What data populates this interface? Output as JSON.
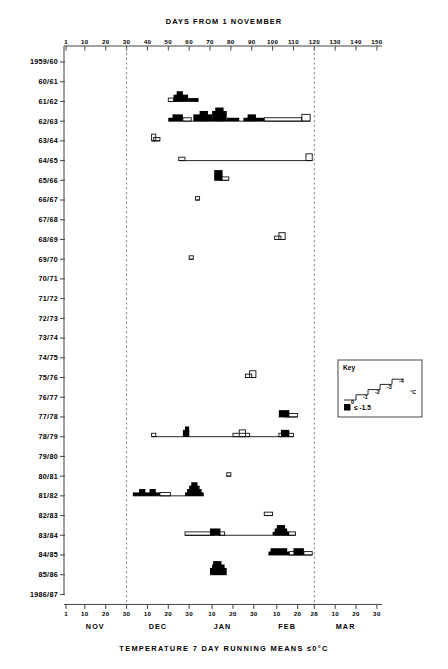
{
  "chart_data": {
    "type": "line",
    "title": "DAYS FROM 1 NOVEMBER",
    "caption": "TEMPERATURE  7 DAY RUNNING MEANS   ≤0°C",
    "xlabel": "DAYS FROM 1 NOVEMBER",
    "ylabel": "",
    "xlim": [
      0,
      155
    ],
    "x_ticks": [
      1,
      10,
      20,
      30,
      40,
      50,
      60,
      70,
      80,
      90,
      100,
      110,
      120,
      130,
      140,
      150
    ],
    "x_tick_labels": [
      "1",
      "10",
      "20",
      "30",
      "40",
      "50",
      "60",
      "70",
      "80",
      "90",
      "100",
      "110",
      "120",
      "130",
      "140",
      "150"
    ],
    "grid": false,
    "legend_position": "right-middle",
    "vertical_dashed_lines": [
      30,
      120
    ],
    "bottom_axis": {
      "label": "calendar days by month",
      "months": [
        {
          "name": "NOV",
          "ticks": [
            {
              "label": "1",
              "day": 1
            },
            {
              "label": "10",
              "day": 10
            },
            {
              "label": "20",
              "day": 20
            },
            {
              "label": "30",
              "day": 30
            }
          ],
          "center_day": 15
        },
        {
          "name": "DEC",
          "ticks": [
            {
              "label": "10",
              "day": 40
            },
            {
              "label": "20",
              "day": 50
            },
            {
              "label": "30",
              "day": 60
            }
          ],
          "center_day": 45
        },
        {
          "name": "JAN",
          "ticks": [
            {
              "label": "10",
              "day": 71
            },
            {
              "label": "20",
              "day": 81
            },
            {
              "label": "30",
              "day": 91
            }
          ],
          "center_day": 76
        },
        {
          "name": "FEB",
          "ticks": [
            {
              "label": "10",
              "day": 102
            },
            {
              "label": "20",
              "day": 112
            },
            {
              "label": "28",
              "day": 120
            }
          ],
          "center_day": 107
        },
        {
          "name": "MAR",
          "ticks": [
            {
              "label": "10",
              "day": 130
            },
            {
              "label": "20",
              "day": 140
            },
            {
              "label": "30",
              "day": 150
            }
          ],
          "center_day": 135
        }
      ]
    },
    "key": {
      "title": "Key",
      "unit": "°C",
      "step_labels": [
        "0",
        "-1",
        "-2",
        "-3",
        "-4"
      ],
      "filled_label": "≤ -1.5",
      "filled_color": "#000000"
    },
    "categories": [
      "1959/60",
      "60/61",
      "61/62",
      "62/63",
      "63/64",
      "64/65",
      "65/66",
      "66/67",
      "67/68",
      "68/69",
      "69/70",
      "70/71",
      "71/72",
      "72/73",
      "73/74",
      "74/75",
      "75/76",
      "76/77",
      "77/78",
      "78/79",
      "79/80",
      "80/81",
      "81/82",
      "82/83",
      "83/84",
      "84/85",
      "85/86",
      "1986/87"
    ],
    "series": [
      {
        "name": "1959/60",
        "segments": []
      },
      {
        "name": "60/61",
        "segments": []
      },
      {
        "name": "61/62",
        "segments": [
          {
            "day": 50,
            "width": 2.5,
            "level": 1,
            "filled": false
          },
          {
            "day": 52.5,
            "width": 7,
            "level": 2,
            "filled": true
          },
          {
            "day": 54,
            "width": 3,
            "level": 3,
            "filled": true
          },
          {
            "day": 59.5,
            "width": 5,
            "level": 1,
            "filled": true
          }
        ]
      },
      {
        "name": "62/63",
        "segments": [
          {
            "day": 50,
            "width": 3,
            "level": 1,
            "filled": true
          },
          {
            "day": 52,
            "width": 5,
            "level": 2,
            "filled": true
          },
          {
            "day": 57,
            "width": 4,
            "level": 1,
            "filled": false
          },
          {
            "day": 62,
            "width": 9,
            "level": 2,
            "filled": true
          },
          {
            "day": 65,
            "width": 4,
            "level": 3,
            "filled": true
          },
          {
            "day": 71,
            "width": 7,
            "level": 3,
            "filled": true
          },
          {
            "day": 72.5,
            "width": 4,
            "level": 4,
            "filled": true
          },
          {
            "day": 78,
            "width": 6,
            "level": 1,
            "filled": true
          },
          {
            "day": 88,
            "width": 4,
            "level": 2,
            "filled": true
          },
          {
            "day": 86,
            "width": 10,
            "level": 1,
            "filled": true
          },
          {
            "day": 96,
            "width": 18,
            "level": 1,
            "filled": false
          },
          {
            "day": 114,
            "width": 4,
            "level": 2,
            "filled": false
          }
        ]
      },
      {
        "name": "63/64",
        "segments": [
          {
            "day": 42,
            "width": 2,
            "level": 2,
            "filled": false
          },
          {
            "day": 43,
            "width": 3,
            "level": 1,
            "filled": false
          }
        ]
      },
      {
        "name": "64/65",
        "segments": [
          {
            "day": 55,
            "width": 3,
            "level": 1,
            "filled": false
          },
          {
            "day": 116,
            "width": 3,
            "level": 2,
            "filled": false
          }
        ]
      },
      {
        "name": "65/66",
        "segments": [
          {
            "day": 72,
            "width": 4,
            "level": 3,
            "filled": true
          },
          {
            "day": 75,
            "width": 4,
            "level": 1,
            "filled": false
          }
        ]
      },
      {
        "name": "66/67",
        "segments": [
          {
            "day": 63,
            "width": 2,
            "level": 1,
            "filled": false
          }
        ]
      },
      {
        "name": "67/68",
        "segments": []
      },
      {
        "name": "68/69",
        "segments": [
          {
            "day": 101,
            "width": 3,
            "level": 1,
            "filled": false
          },
          {
            "day": 103,
            "width": 3,
            "level": 2,
            "filled": false
          }
        ]
      },
      {
        "name": "69/70",
        "segments": [
          {
            "day": 60,
            "width": 2,
            "level": 1,
            "filled": false
          }
        ]
      },
      {
        "name": "70/71",
        "segments": []
      },
      {
        "name": "71/72",
        "segments": []
      },
      {
        "name": "72/73",
        "segments": []
      },
      {
        "name": "73/74",
        "segments": []
      },
      {
        "name": "74/75",
        "segments": []
      },
      {
        "name": "75/76",
        "segments": [
          {
            "day": 87,
            "width": 3,
            "level": 1,
            "filled": false
          },
          {
            "day": 89,
            "width": 3,
            "level": 2,
            "filled": false
          }
        ]
      },
      {
        "name": "76/77",
        "segments": []
      },
      {
        "name": "77/78",
        "segments": [
          {
            "day": 103,
            "width": 5,
            "level": 2,
            "filled": true
          },
          {
            "day": 106,
            "width": 6,
            "level": 1,
            "filled": false
          }
        ]
      },
      {
        "name": "78/79",
        "segments": [
          {
            "day": 42,
            "width": 2,
            "level": 1,
            "filled": false
          },
          {
            "day": 57,
            "width": 3,
            "level": 2,
            "filled": true
          },
          {
            "day": 58,
            "width": 2,
            "level": 3,
            "filled": true
          },
          {
            "day": 84,
            "width": 3,
            "level": 2,
            "filled": false
          },
          {
            "day": 81,
            "width": 8,
            "level": 1,
            "filled": false
          },
          {
            "day": 104,
            "width": 4,
            "level": 2,
            "filled": true
          },
          {
            "day": 103,
            "width": 7,
            "level": 1,
            "filled": false
          }
        ]
      },
      {
        "name": "79/80",
        "segments": []
      },
      {
        "name": "80/81",
        "segments": [
          {
            "day": 78,
            "width": 2,
            "level": 1,
            "filled": false
          }
        ]
      },
      {
        "name": "81/82",
        "segments": [
          {
            "day": 33,
            "width": 13,
            "level": 1,
            "filled": true
          },
          {
            "day": 36,
            "width": 3,
            "level": 2,
            "filled": true
          },
          {
            "day": 41,
            "width": 3,
            "level": 2,
            "filled": true
          },
          {
            "day": 46,
            "width": 5,
            "level": 1,
            "filled": false
          },
          {
            "day": 58,
            "width": 9,
            "level": 1,
            "filled": true
          },
          {
            "day": 59,
            "width": 7,
            "level": 2,
            "filled": true
          },
          {
            "day": 60,
            "width": 5,
            "level": 3,
            "filled": true
          },
          {
            "day": 61,
            "width": 3,
            "level": 4,
            "filled": true
          }
        ]
      },
      {
        "name": "82/83",
        "segments": [
          {
            "day": 96,
            "width": 4,
            "level": 1,
            "filled": false
          }
        ]
      },
      {
        "name": "83/84",
        "segments": [
          {
            "day": 58,
            "width": 14,
            "level": 1,
            "filled": false
          },
          {
            "day": 70,
            "width": 5,
            "level": 2,
            "filled": true
          },
          {
            "day": 74,
            "width": 3,
            "level": 1,
            "filled": false
          },
          {
            "day": 100,
            "width": 8,
            "level": 1,
            "filled": true
          },
          {
            "day": 101,
            "width": 6,
            "level": 2,
            "filled": true
          },
          {
            "day": 102,
            "width": 4,
            "level": 3,
            "filled": true
          },
          {
            "day": 107,
            "width": 4,
            "level": 1,
            "filled": false
          }
        ]
      },
      {
        "name": "84/85",
        "segments": [
          {
            "day": 98,
            "width": 10,
            "level": 1,
            "filled": true
          },
          {
            "day": 99,
            "width": 8,
            "level": 2,
            "filled": true
          },
          {
            "day": 108,
            "width": 6,
            "level": 1,
            "filled": false
          },
          {
            "day": 110,
            "width": 5,
            "level": 2,
            "filled": true
          },
          {
            "day": 115,
            "width": 4,
            "level": 1,
            "filled": false
          }
        ]
      },
      {
        "name": "85/86",
        "segments": [
          {
            "day": 70,
            "width": 8,
            "level": 2,
            "filled": true
          },
          {
            "day": 71,
            "width": 6,
            "level": 3,
            "filled": true
          },
          {
            "day": 71.5,
            "width": 4,
            "level": 4,
            "filled": true
          }
        ]
      },
      {
        "name": "1986/87",
        "segments": []
      }
    ]
  }
}
